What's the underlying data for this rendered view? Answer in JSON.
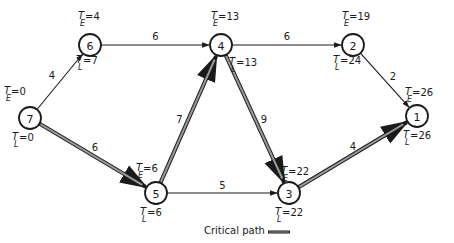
{
  "diagram": {
    "type": "activity-network",
    "nodes": [
      {
        "id": "7",
        "label": "7",
        "x": 30,
        "y": 118,
        "TE": "0",
        "TL": "0"
      },
      {
        "id": "6",
        "label": "6",
        "x": 90,
        "y": 45,
        "TE": "4",
        "TL": "7"
      },
      {
        "id": "5",
        "label": "5",
        "x": 156,
        "y": 193,
        "TE": "6",
        "TL": "6"
      },
      {
        "id": "4",
        "label": "4",
        "x": 221,
        "y": 45,
        "TE": "13",
        "TL": "13"
      },
      {
        "id": "3",
        "label": "3",
        "x": 289,
        "y": 193,
        "TE": "22",
        "TL": "22"
      },
      {
        "id": "2",
        "label": "2",
        "x": 353,
        "y": 45,
        "TE": "19",
        "TL": "24"
      },
      {
        "id": "1",
        "label": "1",
        "x": 417,
        "y": 116,
        "TE": "26",
        "TL": "26"
      }
    ],
    "edges": [
      {
        "from": "7",
        "to": "6",
        "weight": "4",
        "critical": false
      },
      {
        "from": "7",
        "to": "5",
        "weight": "6",
        "critical": true
      },
      {
        "from": "6",
        "to": "4",
        "weight": "6",
        "critical": false
      },
      {
        "from": "5",
        "to": "4",
        "weight": "7",
        "critical": true
      },
      {
        "from": "5",
        "to": "3",
        "weight": "5",
        "critical": false
      },
      {
        "from": "4",
        "to": "2",
        "weight": "6",
        "critical": false
      },
      {
        "from": "4",
        "to": "3",
        "weight": "9",
        "critical": true
      },
      {
        "from": "2",
        "to": "1",
        "weight": "2",
        "critical": false
      },
      {
        "from": "3",
        "to": "1",
        "weight": "4",
        "critical": true
      }
    ],
    "labels": {
      "te_symbol": "T",
      "te_subscript": "E",
      "tl_symbol": "T",
      "tl_subscript": "L"
    },
    "legend": {
      "critical_path_label": "Critical path"
    },
    "colors": {
      "stroke": "#1a1a1a",
      "critical_fill": "#9a9a9a",
      "background": "#ffffff"
    }
  }
}
